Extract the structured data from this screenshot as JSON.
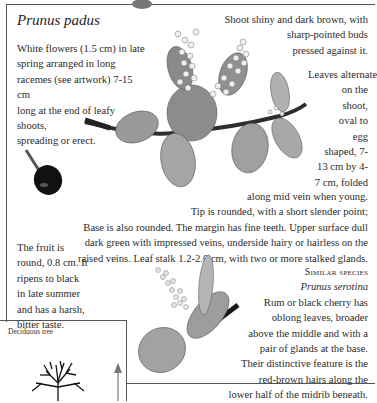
{
  "page": {
    "title": "Prunus padus",
    "intro_lines": [
      "White flowers (1.5 cm) in late",
      "spring arranged in long",
      "racemes (see artwork) 7-15 cm",
      "long at the end of leafy shoots,",
      "spreading or erect."
    ],
    "shoot_lines": [
      "Shoot shiny and dark brown, with",
      "sharp-pointed buds",
      "pressed against it."
    ],
    "leaves_lines_narrow": [
      "Leaves alternate",
      "on the",
      "shoot,",
      "oval to",
      "egg",
      "shaped, 7-",
      "13 cm by 4-",
      "7 cm, folded"
    ],
    "leaves_lines_wide": [
      "along mid vein when young.",
      "Tip is rounded, with a short slender point;",
      "Base is also rounded. The margin has fine teeth. Upper surface dull",
      "dark green with impressed veins, underside hairy or hairless on the",
      "raised veins. Leaf stalk 1.2-2.0 cm, with two or more stalked glands."
    ],
    "fruit_lines": [
      "The fruit is",
      "round, 0.8 cm. It",
      "ripens to black",
      "in late summer",
      "and has a harsh,",
      "bitter taste."
    ],
    "similar_species": {
      "heading": "Similar species",
      "name": "Prunus serotina",
      "lines": [
        "Rum or black cherry has",
        "oblong leaves, broader",
        "above the middle and with a",
        "pair of glands at the base.",
        "Their distinctive feature is the",
        "red-brown hairs along the",
        "lower half of the midrib beneath."
      ]
    },
    "tree_box": {
      "label": "Deciduous tree"
    },
    "illustrations": {
      "main": "flowering-branch-illustration",
      "fruit": "fruit-illustration",
      "similar": "prunus-serotina-illustration",
      "tree": "tree-silhouette-icon",
      "height_arrow": "height-arrow-icon"
    }
  }
}
